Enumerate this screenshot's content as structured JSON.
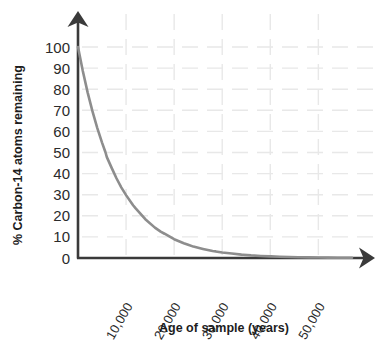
{
  "chart_data": {
    "type": "line",
    "title": "",
    "xlabel": "Age of sample (years)",
    "ylabel": "% Carbon-14 atoms remaining",
    "xlim": [
      0,
      57000
    ],
    "ylim": [
      0,
      100
    ],
    "grid": true,
    "legend": false,
    "x_ticks": [
      "10,000",
      "20,000",
      "30,000",
      "40,000",
      "50,000"
    ],
    "x_tick_values": [
      10000,
      20000,
      30000,
      40000,
      50000
    ],
    "y_ticks": [
      "0",
      "10",
      "20",
      "30",
      "40",
      "50",
      "60",
      "70",
      "80",
      "90",
      "100"
    ],
    "y_tick_values": [
      0,
      10,
      20,
      30,
      40,
      50,
      60,
      70,
      80,
      90,
      100
    ],
    "series": [
      {
        "name": "Carbon-14 decay",
        "color": "#8d8d8d",
        "half_life_years": 5730,
        "x": [
          0,
          1000,
          2000,
          3000,
          4000,
          5000,
          5730,
          6000,
          7000,
          8000,
          9000,
          10000,
          11460,
          12000,
          14000,
          16000,
          17190,
          18000,
          20000,
          22000,
          22920,
          24000,
          26000,
          28000,
          28650,
          30000,
          32000,
          34000,
          34380,
          36000,
          38000,
          40000,
          40110,
          42000,
          44000,
          45840,
          46000,
          48000,
          50000,
          52000,
          54000,
          56000,
          57000
        ],
        "y": [
          100,
          88.6,
          78.5,
          69.6,
          61.7,
          54.7,
          50,
          47.8,
          42.7,
          37.8,
          33.5,
          29.8,
          25,
          23.5,
          18.4,
          14.4,
          12.5,
          11.5,
          8.9,
          7.0,
          6.25,
          5.4,
          4.3,
          3.3,
          3.125,
          2.6,
          2.1,
          1.6,
          1.56,
          1.25,
          0.97,
          0.77,
          0.78,
          0.6,
          0.47,
          0.39,
          0.38,
          0.3,
          0.23,
          0.18,
          0.14,
          0.11,
          0.1
        ]
      }
    ]
  },
  "axes": {
    "y_axis_arrow": "up-arrow-icon",
    "x_axis_arrow": "right-arrow-icon",
    "axis_color": "#3a3a3a",
    "grid_color": "#e8e8e8"
  }
}
